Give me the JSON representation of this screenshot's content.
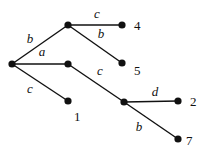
{
  "diagram": {
    "type": "tree",
    "nodes": [
      {
        "id": "root",
        "label": ""
      },
      {
        "id": "n_b",
        "label": ""
      },
      {
        "id": "n_a",
        "label": ""
      },
      {
        "id": "n_c2",
        "label": ""
      },
      {
        "id": "leaf4",
        "label": "4"
      },
      {
        "id": "leaf5",
        "label": "5"
      },
      {
        "id": "leaf1",
        "label": "1"
      },
      {
        "id": "leaf2",
        "label": "2"
      },
      {
        "id": "leaf7",
        "label": "7"
      }
    ],
    "edges": [
      {
        "from": "root",
        "to": "n_b",
        "label": "b"
      },
      {
        "from": "root",
        "to": "n_a",
        "label": "a"
      },
      {
        "from": "root",
        "to": "leaf1",
        "label": "c"
      },
      {
        "from": "n_b",
        "to": "leaf4",
        "label": "c"
      },
      {
        "from": "n_b",
        "to": "leaf5",
        "label": "b"
      },
      {
        "from": "n_a",
        "to": "n_c2",
        "label": "c"
      },
      {
        "from": "n_c2",
        "to": "leaf2",
        "label": "d"
      },
      {
        "from": "n_c2",
        "to": "leaf7",
        "label": "b"
      }
    ]
  }
}
